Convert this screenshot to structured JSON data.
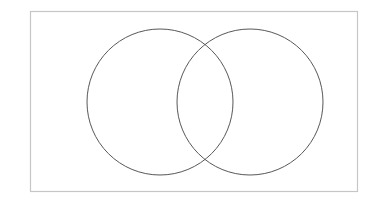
{
  "canvas": {
    "width": 382,
    "height": 208,
    "background": "#ffffff"
  },
  "diagram": {
    "type": "venn-diagram",
    "set_count": 2,
    "title": "",
    "labels": [],
    "universe_box": {
      "name": "universal-set-rectangle",
      "x": 30,
      "y": 11,
      "width": 328,
      "height": 181,
      "stroke": "#c6c6c6",
      "stroke_width": 1.2,
      "fill": "none",
      "label": ""
    },
    "circles": [
      {
        "name": "left-set-circle",
        "label": "",
        "cx": 160,
        "cy": 102,
        "r": 73,
        "stroke": "#58585a",
        "stroke_width": 1,
        "fill": "none"
      },
      {
        "name": "right-set-circle",
        "label": "",
        "cx": 250,
        "cy": 102,
        "r": 73,
        "stroke": "#58585a",
        "stroke_width": 1,
        "fill": "none"
      }
    ],
    "intersection": {
      "name": "intersection-lens",
      "label": "",
      "upper_point": {
        "x": 205,
        "y": 44
      },
      "lower_point": {
        "x": 205,
        "y": 160
      }
    },
    "regions": [
      {
        "name": "left-only-region",
        "label": ""
      },
      {
        "name": "intersection-region",
        "label": ""
      },
      {
        "name": "right-only-region",
        "label": ""
      },
      {
        "name": "outside-region",
        "label": ""
      }
    ]
  }
}
